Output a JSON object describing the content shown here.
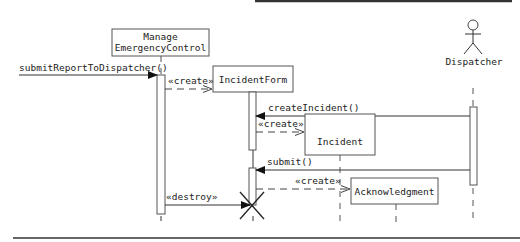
{
  "diagram": {
    "type": "UML sequence diagram",
    "participants": [
      {
        "id": "manage",
        "label_line1": "Manage",
        "label_line2": "EmergencyControl",
        "kind": "object"
      },
      {
        "id": "incidentform",
        "label": "IncidentForm",
        "kind": "object"
      },
      {
        "id": "incident",
        "label": "Incident",
        "kind": "object"
      },
      {
        "id": "acknowledgment",
        "label": "Acknowledgment",
        "kind": "object"
      },
      {
        "id": "dispatcher",
        "label": "Dispatcher",
        "kind": "actor"
      }
    ],
    "messages": [
      {
        "from": "external",
        "to": "manage",
        "label": "submitReportToDispatcher()",
        "style": "sync"
      },
      {
        "from": "manage",
        "to": "incidentform",
        "label": "«create»",
        "style": "dashed-create"
      },
      {
        "from": "dispatcher",
        "to": "incidentform",
        "label": "createIncident()",
        "style": "sync"
      },
      {
        "from": "incidentform",
        "to": "incident",
        "label": "«create»",
        "style": "dashed-create"
      },
      {
        "from": "dispatcher",
        "to": "incidentform",
        "label": "submit()",
        "style": "sync"
      },
      {
        "from": "incidentform",
        "to": "acknowledgment",
        "label": "«create»",
        "style": "dashed-create"
      },
      {
        "from": "manage",
        "to": "incidentform",
        "label": "«destroy»",
        "style": "destroy"
      }
    ],
    "colors": {
      "stroke": "#333333",
      "background": "#ffffff",
      "text": "#222222"
    }
  }
}
